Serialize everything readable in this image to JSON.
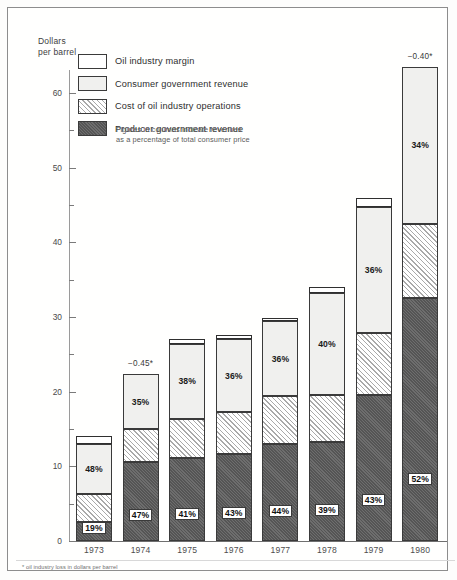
{
  "axis_title_line1": "Dollars",
  "axis_title_line2": "per barrel",
  "footnote": "* oil industry loss in dollars per barrel",
  "legend": {
    "note_line1": "Figures in columns indicate revenues",
    "note_line2": "as a percentage of total consumer price",
    "items": [
      {
        "label": "Oil industry margin",
        "key": "margin",
        "color": "#ffffff"
      },
      {
        "label": "Consumer government revenue",
        "key": "consumer",
        "color": "#f0f0ee"
      },
      {
        "label": "Cost of oil industry operations",
        "key": "cost",
        "color": "#e3e3e1"
      },
      {
        "label": "Producer government revenue",
        "key": "producer",
        "color": "#5f5f5f"
      }
    ]
  },
  "chart_data": {
    "type": "bar",
    "subtype": "stacked",
    "title": "",
    "xlabel": "",
    "ylabel": "Dollars per barrel",
    "ylim": [
      0,
      65
    ],
    "yticks": [
      0,
      10,
      20,
      30,
      40,
      50,
      60
    ],
    "ytick_labels": [
      "0",
      "10",
      "20",
      "30",
      "40",
      "50",
      "60"
    ],
    "yminor_ticks": [
      5,
      15,
      25,
      35,
      45,
      55,
      65
    ],
    "grid": false,
    "legend_position": "top-left",
    "categories": [
      "1973",
      "1974",
      "1975",
      "1976",
      "1977",
      "1978",
      "1979",
      "1980"
    ],
    "series": [
      {
        "name": "Producer government revenue",
        "key": "producer",
        "values": [
          2.6,
          10.6,
          11.1,
          11.6,
          13.0,
          13.2,
          19.5,
          32.5
        ]
      },
      {
        "name": "Cost of oil industry operations",
        "key": "cost",
        "values": [
          3.7,
          4.4,
          5.3,
          5.7,
          6.4,
          6.4,
          8.4,
          10.0
        ]
      },
      {
        "name": "Consumer government revenue",
        "key": "consumer",
        "values": [
          6.7,
          7.3,
          10.0,
          9.7,
          10.0,
          13.6,
          16.8,
          21.0
        ]
      },
      {
        "name": "Oil industry margin",
        "key": "margin",
        "values": [
          1.0,
          0.0,
          0.7,
          0.6,
          0.4,
          0.8,
          1.3,
          0.0
        ]
      }
    ],
    "totals": [
      14.0,
      22.3,
      27.1,
      27.6,
      29.8,
      34.0,
      46.0,
      63.5
    ],
    "bar_labels": [
      {
        "year": "1973",
        "consumer_pct": "48%",
        "producer_pct": "19%"
      },
      {
        "year": "1974",
        "consumer_pct": "35%",
        "producer_pct": "47%"
      },
      {
        "year": "1975",
        "consumer_pct": "38%",
        "producer_pct": "41%"
      },
      {
        "year": "1976",
        "consumer_pct": "36%",
        "producer_pct": "43%"
      },
      {
        "year": "1977",
        "consumer_pct": "36%",
        "producer_pct": "44%"
      },
      {
        "year": "1978",
        "consumer_pct": "40%",
        "producer_pct": "39%"
      },
      {
        "year": "1979",
        "consumer_pct": "36%",
        "producer_pct": "43%"
      },
      {
        "year": "1980",
        "consumer_pct": "34%",
        "producer_pct": "52%"
      }
    ],
    "annotations": [
      {
        "year": "1974",
        "text": "−0.45*"
      },
      {
        "year": "1980",
        "text": "−0.40*"
      }
    ]
  }
}
